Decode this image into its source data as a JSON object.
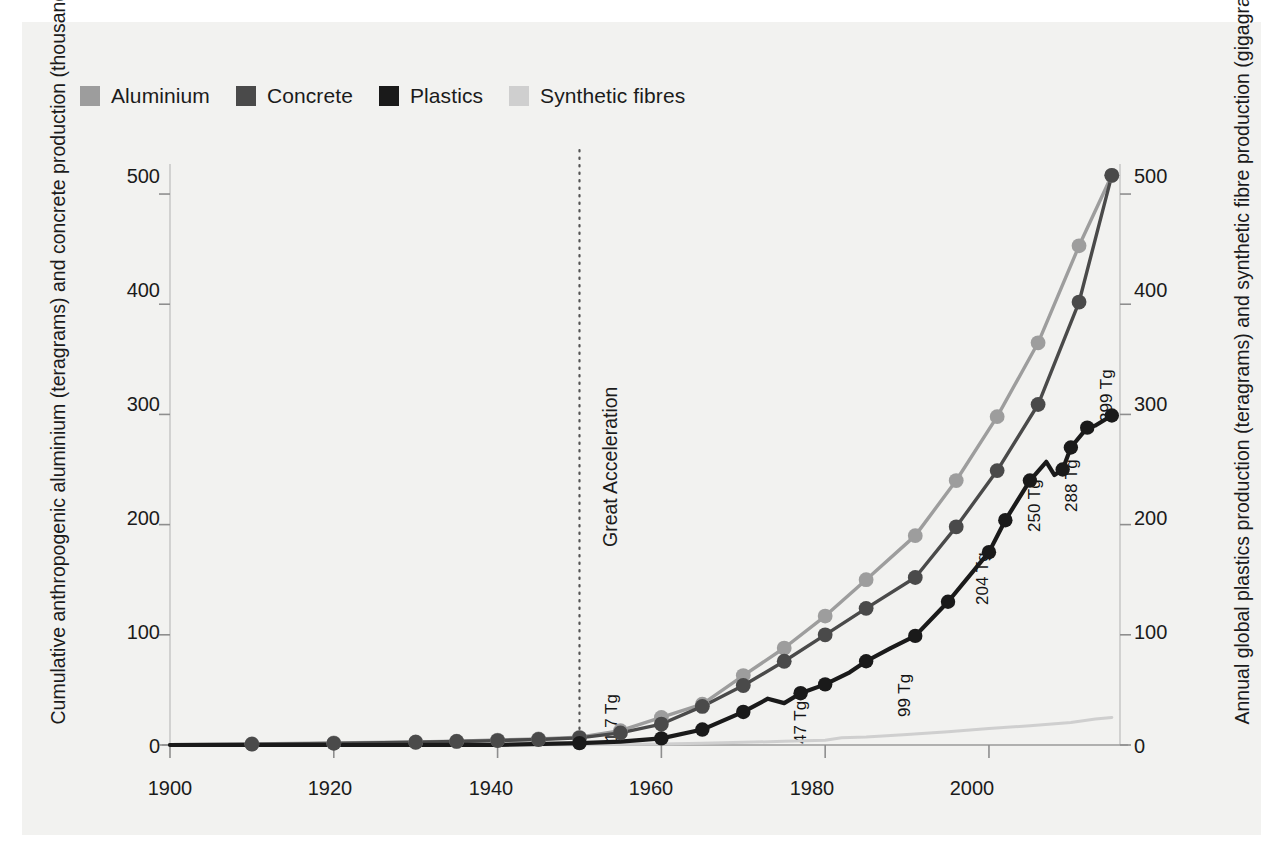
{
  "legend": {
    "items": [
      {
        "label": "Aluminium",
        "color": "#9d9d9d",
        "icon": "legend-swatch-icon"
      },
      {
        "label": "Concrete",
        "color": "#4a4a4a",
        "icon": "legend-swatch-icon"
      },
      {
        "label": "Plastics",
        "color": "#1a1a1a",
        "icon": "legend-swatch-icon"
      },
      {
        "label": "Synthetic fibres",
        "color": "#cfcfcf",
        "icon": "legend-swatch-icon"
      }
    ]
  },
  "axes": {
    "ylabel_left": "Cumulative anthropogenic aluminium (teragrams) and concrete production (thousand teragrams)",
    "ylabel_right": "Annual global plastics production (teragrams) and synthetic fibre production (gigagrams)",
    "xlabel": "",
    "yticks_left": [
      "0",
      "100",
      "200",
      "300",
      "400",
      "500"
    ],
    "yticks_right": [
      "0",
      "100",
      "200",
      "300",
      "400",
      "500"
    ],
    "xticks": [
      "1900",
      "1920",
      "1940",
      "1960",
      "1980",
      "2000"
    ]
  },
  "annotations": {
    "great_acceleration": "Great Acceleration",
    "plastics_labels": [
      "1.7 Tg",
      "47 Tg",
      "99 Tg",
      "204 Tg",
      "250 Tg",
      "288 Tg",
      "299 Tg"
    ]
  },
  "chart_data": {
    "type": "line",
    "title": "",
    "xlabel": "",
    "ylabel": "Cumulative anthropogenic aluminium (teragrams) and concrete production (thousand teragrams)",
    "ylabel_right": "Annual global plastics production (teragrams) and synthetic fibre production (gigagrams)",
    "xlim": [
      1900,
      2016
    ],
    "ylim": [
      0,
      520
    ],
    "ylim_right": [
      0,
      520
    ],
    "grid": false,
    "legend_position": "top-left",
    "vline": {
      "x": 1950,
      "label": "Great Acceleration",
      "style": "dotted"
    },
    "series": [
      {
        "name": "Aluminium",
        "color": "#9d9d9d",
        "axis": "left",
        "markers": true,
        "x": [
          1900,
          1910,
          1920,
          1930,
          1935,
          1940,
          1945,
          1950,
          1955,
          1960,
          1965,
          1970,
          1975,
          1980,
          1985,
          1991,
          1996,
          2001,
          2006,
          2011,
          2015
        ],
        "y": [
          0.3,
          1.0,
          1.8,
          2.8,
          3.5,
          4.5,
          5.5,
          7.0,
          13.0,
          25.0,
          37.0,
          63.0,
          88.0,
          117.0,
          150.0,
          190.0,
          240.0,
          298.0,
          365.0,
          453.0,
          517.0
        ]
      },
      {
        "name": "Concrete",
        "color": "#4a4a4a",
        "axis": "left",
        "markers": true,
        "x": [
          1900,
          1910,
          1920,
          1930,
          1935,
          1940,
          1945,
          1950,
          1955,
          1960,
          1965,
          1970,
          1975,
          1980,
          1985,
          1991,
          1996,
          2001,
          2006,
          2011,
          2015
        ],
        "y": [
          0.2,
          0.8,
          1.5,
          2.5,
          3.2,
          4.0,
          5.0,
          6.5,
          11.0,
          19.0,
          35.0,
          54.0,
          76.0,
          100.0,
          124.0,
          152.0,
          198.0,
          249.0,
          309.0,
          402.0,
          517.0
        ]
      },
      {
        "name": "Plastics",
        "color": "#1a1a1a",
        "axis": "right",
        "markers": true,
        "x": [
          1900,
          1920,
          1940,
          1950,
          1955,
          1960,
          1965,
          1970,
          1973,
          1975,
          1977,
          1980,
          1983,
          1985,
          1988,
          1991,
          1995,
          2000,
          2002,
          2005,
          2007,
          2008,
          2009,
          2010,
          2012,
          2013,
          2015
        ],
        "y": [
          0.0,
          0.0,
          0.2,
          1.7,
          3.0,
          6.0,
          14.0,
          30.0,
          42.0,
          38.0,
          47.0,
          55.0,
          66.0,
          76.0,
          88.0,
          99.0,
          130.0,
          175.0,
          204.0,
          240.0,
          257.0,
          245.0,
          250.0,
          270.0,
          288.0,
          290.0,
          299.0
        ],
        "labels": [
          {
            "x": 1950,
            "y": 1.7,
            "text": "1.7 Tg"
          },
          {
            "x": 1977,
            "y": 47.0,
            "text": "47 Tg"
          },
          {
            "x": 1991,
            "y": 99.0,
            "text": "99 Tg"
          },
          {
            "x": 2002,
            "y": 204.0,
            "text": "204 Tg"
          },
          {
            "x": 2009,
            "y": 250.0,
            "text": "250 Tg"
          },
          {
            "x": 2012,
            "y": 288.0,
            "text": "288 Tg"
          },
          {
            "x": 2015,
            "y": 299.0,
            "text": "299 Tg"
          }
        ]
      },
      {
        "name": "Synthetic fibres",
        "color": "#cfcfcf",
        "axis": "right",
        "markers": false,
        "x": [
          1900,
          1940,
          1950,
          1955,
          1960,
          1965,
          1970,
          1975,
          1980,
          1982,
          1985,
          1990,
          1995,
          2000,
          2005,
          2010,
          2013,
          2015
        ],
        "y": [
          0.0,
          0.1,
          0.3,
          0.6,
          1.0,
          1.6,
          2.4,
          3.3,
          4.4,
          6.5,
          7.2,
          9.5,
          12.0,
          15.0,
          17.5,
          20.5,
          23.5,
          25.0
        ]
      }
    ]
  }
}
